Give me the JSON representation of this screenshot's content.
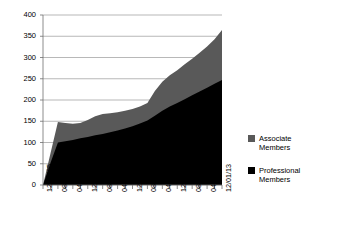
{
  "chart_data": {
    "type": "area",
    "stacked": true,
    "title": "",
    "xlabel": "",
    "ylabel": "",
    "ylim": [
      0,
      400
    ],
    "yticks": [
      0,
      50,
      100,
      150,
      200,
      250,
      300,
      350,
      400
    ],
    "grid": true,
    "legend_position": "right",
    "x": [
      "12/01/05",
      "04/01/06",
      "08/01/06",
      "12/01/06",
      "04/01/07",
      "08/01/07",
      "12/01/07",
      "04/01/08",
      "08/01/08",
      "12/01/08",
      "04/01/09",
      "08/01/09",
      "12/01/09",
      "04/01/10",
      "08/01/10",
      "12/01/10",
      "04/01/11",
      "08/01/11",
      "12/01/11",
      "04/01/12",
      "08/01/12",
      "12/01/12",
      "04/01/13",
      "08/01/13",
      "12/01/13"
    ],
    "xtick_labels": [
      "12/01/05",
      "08/01/06",
      "04/01/07",
      "12/01/07",
      "08/01/08",
      "04/01/09",
      "12/01/09",
      "08/01/10",
      "04/01/11",
      "12/01/11",
      "08/01/12",
      "04/01/13",
      "12/01/13"
    ],
    "series": [
      {
        "name": "Professional Members",
        "color": "#000000",
        "values": [
          0,
          52,
          100,
          103,
          106,
          110,
          113,
          117,
          120,
          124,
          128,
          133,
          138,
          145,
          152,
          163,
          175,
          185,
          193,
          202,
          211,
          220,
          229,
          238,
          247
        ]
      },
      {
        "name": "Associate Members",
        "color": "#595959",
        "values": [
          0,
          22,
          48,
          43,
          38,
          36,
          40,
          45,
          47,
          45,
          43,
          42,
          41,
          40,
          41,
          58,
          68,
          73,
          77,
          82,
          86,
          91,
          97,
          105,
          118
        ]
      }
    ],
    "totals": [
      0,
      74,
      148,
      146,
      144,
      146,
      153,
      162,
      167,
      169,
      171,
      175,
      179,
      185,
      193,
      221,
      243,
      258,
      270,
      284,
      297,
      311,
      326,
      343,
      365
    ]
  },
  "legend": {
    "items": [
      {
        "label_line1": "Associate",
        "label_line2": "Members",
        "color": "#595959"
      },
      {
        "label_line1": "Professional",
        "label_line2": "Members",
        "color": "#000000"
      }
    ]
  }
}
